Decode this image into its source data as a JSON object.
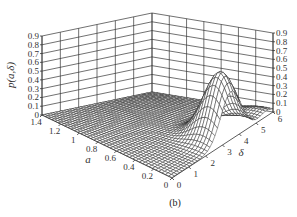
{
  "figure": {
    "caption": "(b)"
  },
  "chart_data": {
    "type": "surface3d",
    "title": "",
    "xlabel": "a",
    "ylabel": "δ",
    "zlabel": "p(a,δ)",
    "x_ticks": [
      "0",
      "0.2",
      "0.4",
      "0.6",
      "0.8",
      "1",
      "1.2",
      "1.4"
    ],
    "y_ticks": [
      "0",
      "1",
      "2",
      "3",
      "4",
      "5",
      "6"
    ],
    "z_ticks": [
      "0",
      "0.1",
      "0.2",
      "0.3",
      "0.4",
      "0.5",
      "0.6",
      "0.7",
      "0.8",
      "0.9"
    ],
    "xlim": [
      0,
      1.4
    ],
    "ylim": [
      0,
      6
    ],
    "zlim": [
      0,
      0.9
    ],
    "grid": true,
    "peak": {
      "a": 0.15,
      "delta": 3.5,
      "p": 0.73
    },
    "left_tick_labels_z": [
      "0.9",
      "0.8",
      "0.7",
      "0.6",
      "0.5",
      "0.4",
      "0.3",
      "0.2",
      "0.1",
      "0"
    ],
    "right_tick_labels_z": [
      "0.9",
      "0.8",
      "0.7",
      "0.6",
      "0.5",
      "0.4",
      "0.3",
      "0.2",
      "0.1",
      "0"
    ]
  }
}
